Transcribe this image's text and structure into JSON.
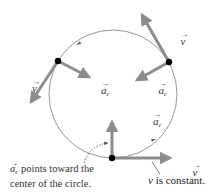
{
  "diagram": {
    "colors": {
      "circle": "#777777",
      "arrow": "#8c8c8c",
      "dot": "#000000",
      "text": "#333333"
    },
    "circle": {
      "cx": 113,
      "cy": 94,
      "r": 64,
      "direction": "counterclockwise"
    },
    "points": [
      {
        "name": "upper-left",
        "x": 58,
        "y": 61,
        "velocity": {
          "label_symbol": "v",
          "to": [
            30,
            103
          ]
        },
        "acceleration": {
          "label_symbol": "a",
          "label_subscript": "c",
          "to": [
            90,
            78
          ]
        }
      },
      {
        "name": "upper-right",
        "x": 169,
        "y": 62,
        "velocity": {
          "label_symbol": "v",
          "to": [
            141,
            13
          ]
        },
        "acceleration": {
          "label_symbol": "a",
          "label_subscript": "c",
          "to": [
            136,
            81
          ]
        }
      },
      {
        "name": "bottom",
        "x": 112,
        "y": 158,
        "velocity": {
          "label_symbol": "v",
          "to": [
            172,
            158
          ]
        },
        "acceleration": {
          "label_symbol": "a",
          "label_subscript": "c",
          "to": [
            112,
            120
          ]
        }
      }
    ],
    "labels": {
      "v": "v",
      "a": "a",
      "c": "c",
      "arrow_accent": "→"
    },
    "annotations": {
      "ac_note_line1_suffix": " points toward the",
      "ac_note_line2": "center of the circle.",
      "v_note_symbol": "v",
      "v_note_suffix": " is constant."
    }
  }
}
